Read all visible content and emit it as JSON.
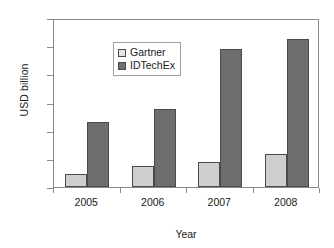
{
  "chart_data": {
    "type": "bar",
    "title": "",
    "subtitle": "",
    "xlabel": "Year",
    "ylabel": "USD billion",
    "categories": [
      "2005",
      "2006",
      "2007",
      "2008"
    ],
    "series": [
      {
        "name": "Gartner",
        "values": [
          0.46,
          0.74,
          0.89,
          1.17
        ],
        "color": "#cfcfcf"
      },
      {
        "name": "IDTechEx",
        "values": [
          2.3,
          2.77,
          4.89,
          5.25
        ],
        "color": "#6e6e6e"
      }
    ],
    "ylim": [
      0,
      6
    ],
    "yticks": [
      0,
      1,
      2,
      3,
      4,
      5,
      6
    ],
    "ytick_labels": [
      "0",
      "1",
      "2",
      "3",
      "4",
      "5",
      "6"
    ],
    "grid": false,
    "legend_position": "top-left inside plot area",
    "annotations": []
  },
  "axes": {
    "y_title": "USD billion",
    "x_title": "Year"
  },
  "legend": {
    "entries": [
      {
        "label": "Gartner",
        "swatch": "legend-swatch-light-gray"
      },
      {
        "label": "IDTechEx",
        "swatch": "legend-swatch-dark-gray"
      }
    ]
  },
  "colors": {
    "series_gartner": "#cfcfcf",
    "series_idtechex": "#6e6e6e",
    "axis": "#8a8a8a",
    "bar_outline": "#4a4a4a",
    "text": "#1a1a1a",
    "background": "#ffffff"
  }
}
